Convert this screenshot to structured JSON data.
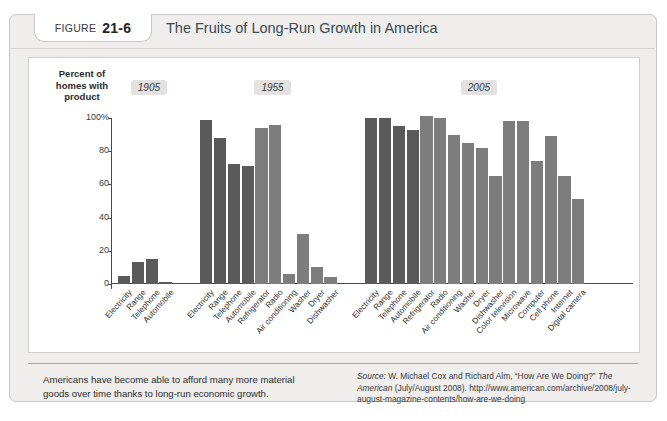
{
  "figure": {
    "tab_word": "FIGURE",
    "tab_number": "21-6",
    "title": "The Fruits of Long-Run Growth in America",
    "caption": "Americans have become able to afford many more material goods over time thanks to long-run economic growth.",
    "source_prefix": "Source:",
    "source_line1": " W. Michael Cox and Richard Alm, “How Are We Doing?” ",
    "source_italic1": "The",
    "source_line2": "American",
    "source_line3": " (July/August 2008). http://www.american.com/archive/2008/",
    "source_line4": "july-august-magazine-contents/how-are-we-doing"
  },
  "colors": {
    "bar_dark": "#5a5a5a",
    "bar_light": "#7d7d7d",
    "axis": "#4a4a4a",
    "panel_bg": "#ffffff",
    "figure_bg": "#efeeec",
    "title_text": "#3b4a55",
    "year_badge_bg": "#e3e2e0"
  },
  "chart_data": {
    "type": "bar",
    "title": "The Fruits of Long-Run Growth in America",
    "ylabel": "Percent of homes with product",
    "xlabel": "",
    "ylim": [
      0,
      100
    ],
    "yticks": [
      0,
      20,
      40,
      60,
      80,
      100
    ],
    "ytick_labels": [
      "0",
      "20",
      "40",
      "60",
      "80",
      "100%"
    ],
    "grid": false,
    "legend": "none",
    "groups": [
      {
        "year": "1905",
        "categories": [
          "Electricity",
          "Range",
          "Telephone",
          "Automobile"
        ],
        "values": [
          5,
          13,
          15,
          1.5
        ],
        "shades": [
          "dark",
          "dark",
          "dark",
          "dark"
        ]
      },
      {
        "year": "1955",
        "categories": [
          "Electricity",
          "Range",
          "Telephone",
          "Automobile",
          "Refrigerator",
          "Radio",
          "Air conditioning",
          "Washer",
          "Dryer",
          "Dishwasher"
        ],
        "values": [
          99,
          88,
          72,
          71,
          94,
          96,
          6,
          30,
          10,
          4
        ],
        "shades": [
          "dark",
          "dark",
          "dark",
          "dark",
          "light",
          "light",
          "light",
          "light",
          "light",
          "light"
        ]
      },
      {
        "year": "2005",
        "categories": [
          "Electricity",
          "Range",
          "Telephone",
          "Automobile",
          "Refrigerator",
          "Radio",
          "Air conditioning",
          "Washer",
          "Dryer",
          "Dishwasher",
          "Color television",
          "Microwave",
          "Computer",
          "Cell phone",
          "Internet",
          "Digital camera"
        ],
        "values": [
          100,
          100,
          95,
          93,
          101,
          100,
          90,
          85,
          82,
          65,
          98,
          98,
          74,
          89,
          65,
          51
        ],
        "shades": [
          "dark",
          "dark",
          "dark",
          "dark",
          "light",
          "light",
          "light",
          "light",
          "light",
          "light",
          "light",
          "light",
          "light",
          "light",
          "light",
          "light"
        ]
      }
    ]
  }
}
